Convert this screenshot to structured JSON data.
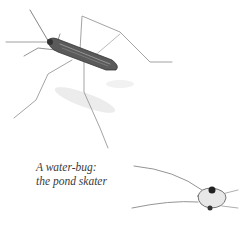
{
  "caption": {
    "line1": "A water-bug:",
    "line2": "the pond skater"
  },
  "colors": {
    "background": "#ffffff",
    "ink": "#3a3a3a",
    "leg": "#8a8a8a",
    "shadow": "#e6e6e6"
  }
}
